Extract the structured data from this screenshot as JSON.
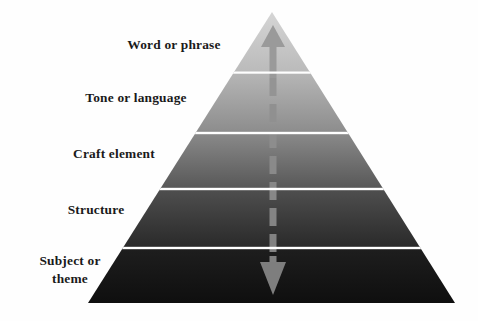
{
  "diagram": {
    "type": "pyramid",
    "title": "",
    "background_color": "#fefefe",
    "text_color": "#1a1a1a",
    "arrow_color": "#8c8c8c",
    "divider_color": "#ffffff",
    "apex": {
      "x": 272,
      "y": 12
    },
    "base": {
      "left_x": 88,
      "right_x": 455,
      "y": 303
    },
    "tiers": [
      {
        "label": "Word or phrase",
        "rank": 1,
        "position": "top",
        "fill_top_color": "#d2d2d2",
        "fill_bottom_color": "#bcbcbc",
        "band_top_y": 12,
        "band_bottom_y": 73
      },
      {
        "label": "Tone or language",
        "rank": 2,
        "position": "upper-middle",
        "fill_top_color": "#b4b4b4",
        "fill_bottom_color": "#8e8e8e",
        "band_top_y": 73,
        "band_bottom_y": 133
      },
      {
        "label": "Craft element",
        "rank": 3,
        "position": "middle",
        "fill_top_color": "#888888",
        "fill_bottom_color": "#595959",
        "band_top_y": 133,
        "band_bottom_y": 189
      },
      {
        "label": "Structure",
        "rank": 4,
        "position": "lower-middle",
        "fill_top_color": "#4e4e4e",
        "fill_bottom_color": "#2b2b2b",
        "band_top_y": 189,
        "band_bottom_y": 248
      },
      {
        "label": "Subject or\ntheme",
        "rank": 5,
        "position": "base",
        "fill_top_color": "#1d1d1d",
        "fill_bottom_color": "#101010",
        "band_top_y": 248,
        "band_bottom_y": 303
      }
    ],
    "arrow": {
      "name": "double-headed-vertical-arrow",
      "style": "dashed-shaft",
      "direction": "bidirectional",
      "color": "#8c8c8c",
      "shaft_x": 273,
      "top_tip_y": 25,
      "bottom_tip_y": 295,
      "shaft_width": 7,
      "head_width": 24,
      "head_height": 22,
      "dash_segments": [
        {
          "y1": 78,
          "y2": 96
        },
        {
          "y1": 104,
          "y2": 122
        },
        {
          "y1": 130,
          "y2": 148
        },
        {
          "y1": 156,
          "y2": 174
        },
        {
          "y1": 182,
          "y2": 200
        },
        {
          "y1": 208,
          "y2": 226
        },
        {
          "y1": 234,
          "y2": 252
        }
      ]
    }
  }
}
